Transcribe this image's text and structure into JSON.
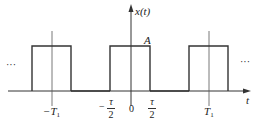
{
  "diagram": {
    "signal_label": "x(t)",
    "amplitude_label": "A",
    "time_axis_label": "t",
    "ellipsis_left": "···",
    "ellipsis_right": "···",
    "ticks": {
      "neg_period": {
        "main": "−T",
        "sub": "1"
      },
      "neg_half_tau": {
        "sign": "−",
        "num": "τ",
        "den": "2"
      },
      "origin": "0",
      "pos_half_tau": {
        "num": "τ",
        "den": "2"
      },
      "pos_period": {
        "main": "T",
        "sub": "1"
      }
    },
    "colors": {
      "stroke": "#333333",
      "text": "#222222",
      "background": "#ffffff"
    }
  }
}
